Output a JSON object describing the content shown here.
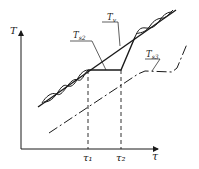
{
  "diagram": {
    "type": "temperature-time diagram",
    "axes": {
      "y_label": "T",
      "x_label": "τ"
    },
    "ticks": {
      "t1": "τ₁",
      "t2": "τ₂"
    },
    "curves": {
      "tv": {
        "label": "T",
        "sub": "v"
      },
      "ts2": {
        "label": "T",
        "sub": "s2"
      },
      "ts3": {
        "label": "T",
        "sub": "s3"
      }
    },
    "colors": {
      "line": "#1a1a1a",
      "background": "#ffffff"
    }
  }
}
